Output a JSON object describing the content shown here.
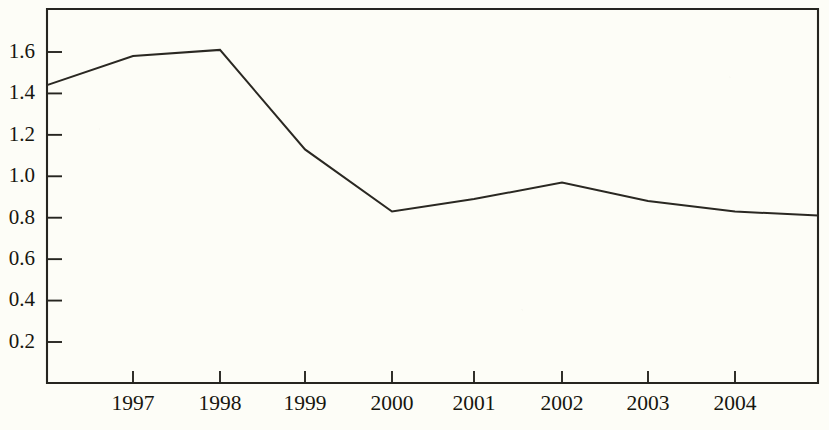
{
  "chart_data": {
    "type": "line",
    "title": "",
    "subtitle": "",
    "xlabel": "",
    "ylabel": "",
    "grid": false,
    "legend": null,
    "legend_position": "none",
    "x_tick_labels": [
      "1997",
      "1998",
      "1999",
      "2000",
      "2001",
      "2002",
      "2003",
      "2004"
    ],
    "y_tick_labels": [
      "0.2",
      "0.4",
      "0.6",
      "0.8",
      "1.0",
      "1.2",
      "1.4",
      "1.6"
    ],
    "y_tick_values": [
      0.2,
      0.4,
      0.6,
      0.8,
      1.0,
      1.2,
      1.4,
      1.6
    ],
    "ylim": [
      0.0,
      1.78
    ],
    "xlim_note": "line extends past first and last labelled ticks to the plot frame edges",
    "categories": [
      "1997",
      "1998",
      "1999",
      "2000",
      "2001",
      "2002",
      "2003",
      "2004"
    ],
    "values": [
      1.58,
      1.61,
      1.13,
      0.83,
      0.89,
      0.97,
      0.88,
      0.83
    ],
    "series": [
      {
        "name": "series-1",
        "color": "#2a2822",
        "points": [
          {
            "x": "left-edge",
            "y": 1.44
          },
          {
            "x": "1997",
            "y": 1.58
          },
          {
            "x": "1998",
            "y": 1.61
          },
          {
            "x": "1999",
            "y": 1.13
          },
          {
            "x": "2000",
            "y": 0.83
          },
          {
            "x": "2001",
            "y": 0.89
          },
          {
            "x": "2002",
            "y": 0.97
          },
          {
            "x": "2003",
            "y": 0.88
          },
          {
            "x": "2004",
            "y": 0.83
          },
          {
            "x": "right-edge",
            "y": 0.81
          }
        ]
      }
    ],
    "colors": {
      "line": "#2a2822",
      "axis": "#262520",
      "background": "#fdfdf7",
      "text": "#17160f"
    }
  },
  "geometry": {
    "plot_left": 47,
    "plot_right": 818,
    "plot_top": 9,
    "plot_bottom": 383,
    "y_value_at_top_scale": 1.6,
    "y_pixel_at_top_scale": 52,
    "y_value_at_bottom_scale": 0.2,
    "y_pixel_at_bottom_scale": 342,
    "x_tick_pixels": [
      133,
      220,
      305,
      392,
      474,
      562,
      648,
      735
    ]
  }
}
